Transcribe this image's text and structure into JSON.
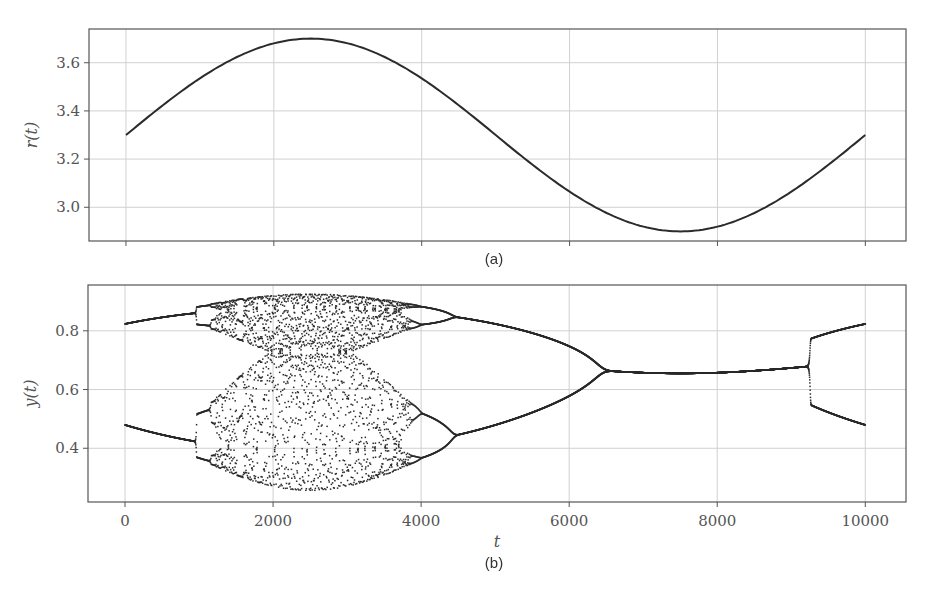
{
  "figure": {
    "caption_a": "(a)",
    "caption_b": "(b)"
  },
  "colors": {
    "line": "#2b2b2b",
    "grid": "#d0d0d0",
    "axis": "#555555",
    "text": "#555555"
  },
  "chart_data": [
    {
      "type": "line",
      "panel": "(a)",
      "title": "",
      "xlabel": "",
      "ylabel": "r(t)",
      "xlim": [
        -500,
        10550
      ],
      "ylim": [
        2.86,
        3.74
      ],
      "xticks": [
        0,
        2000,
        4000,
        6000,
        8000,
        10000
      ],
      "xtick_labels_visible": false,
      "yticks": [
        3.0,
        3.2,
        3.4,
        3.6
      ],
      "ytick_labels": [
        "3.0",
        "3.2",
        "3.4",
        "3.6"
      ],
      "grid": true,
      "series": [
        {
          "name": "r(t)",
          "formula": "3.3 + 0.4*sin(2*pi*t/10000)",
          "x": [
            0,
            1000,
            2000,
            2500,
            3000,
            4000,
            5000,
            6000,
            7000,
            7500,
            8000,
            9000,
            10000
          ],
          "y": [
            3.3,
            3.535,
            3.68,
            3.7,
            3.68,
            3.535,
            3.3,
            3.065,
            2.92,
            2.9,
            2.92,
            3.065,
            3.3
          ]
        }
      ]
    },
    {
      "type": "scatter",
      "panel": "(b)",
      "title": "",
      "xlabel": "t",
      "ylabel": "y(t)",
      "xlim": [
        -500,
        10550
      ],
      "ylim": [
        0.217,
        0.956
      ],
      "xticks": [
        0,
        2000,
        4000,
        6000,
        8000,
        10000
      ],
      "xtick_labels": [
        "0",
        "2000",
        "4000",
        "6000",
        "8000",
        "10000"
      ],
      "yticks": [
        0.4,
        0.6,
        0.8
      ],
      "ytick_labels": [
        "0.4",
        "0.6",
        "0.8"
      ],
      "grid": true,
      "description": "Logistic map y(t+1) = r(t) y(t) (1 - y(t)) iterated with slowly varying r(t); period-2 at t=0 (0.82/0.48), period-doubling cascade into chaos ~1000-4000, reverse cascade merging at ~6500 to fixed point ~0.65, re-splits to period-2 at ~9270 (0.81/0.47 at t=10000)",
      "series": [
        {
          "name": "upper branch",
          "x": [
            0,
            1000,
            4500,
            6500,
            7500,
            9270,
            10000
          ],
          "y": [
            0.82,
            0.86,
            0.84,
            0.655,
            0.645,
            0.66,
            0.81
          ]
        },
        {
          "name": "lower branch",
          "x": [
            0,
            1000,
            4500,
            6500,
            7500,
            9270,
            10000
          ],
          "y": [
            0.48,
            0.42,
            0.44,
            0.655,
            0.645,
            0.66,
            0.47
          ]
        },
        {
          "name": "chaotic band",
          "x_range": [
            1000,
            4500
          ],
          "y_range": [
            0.26,
            0.92
          ]
        }
      ]
    }
  ]
}
